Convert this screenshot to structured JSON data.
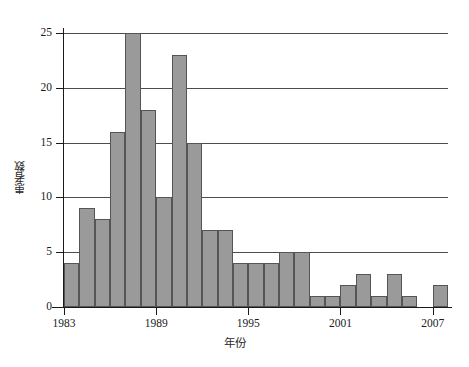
{
  "chart_data": {
    "type": "bar",
    "title": "",
    "subtitle": "",
    "xlabel": "年份",
    "ylabel": "患者数",
    "xlim": [
      1983,
      2008
    ],
    "ylim": [
      0,
      25
    ],
    "grid": true,
    "legend": null,
    "bar_color": "#9a9a9a",
    "bar_edge_color": "#555555",
    "axis_color": "#1a1a1a",
    "gridline_color": "#4c4c4c",
    "y_ticks": [
      0,
      5,
      10,
      15,
      20,
      25
    ],
    "y_tick_labels": [
      "0",
      "5",
      "10",
      "15",
      "20",
      "25"
    ],
    "x_ticks": [
      1983,
      1989,
      1995,
      2001,
      2007
    ],
    "x_tick_labels": [
      "1983",
      "1989",
      "1995",
      "2001",
      "2007"
    ],
    "categories": [
      1983,
      1984,
      1985,
      1986,
      1987,
      1988,
      1989,
      1990,
      1991,
      1992,
      1993,
      1994,
      1995,
      1996,
      1997,
      1998,
      1999,
      2000,
      2001,
      2002,
      2003,
      2004,
      2005,
      2006,
      2007
    ],
    "values": [
      4,
      9,
      8,
      16,
      25,
      18,
      10,
      23,
      15,
      7,
      7,
      4,
      4,
      4,
      5,
      5,
      1,
      1,
      2,
      3,
      1,
      3,
      1,
      0,
      2
    ],
    "total": 162,
    "max_value": 25,
    "max_value_year": 1987
  }
}
